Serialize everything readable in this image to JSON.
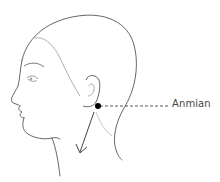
{
  "diagram": {
    "point": {
      "label": "Anmian",
      "marker_color": "#000000",
      "position": [
        98,
        106
      ]
    },
    "line_color": "#555555",
    "arrow_direction": "down-left"
  }
}
